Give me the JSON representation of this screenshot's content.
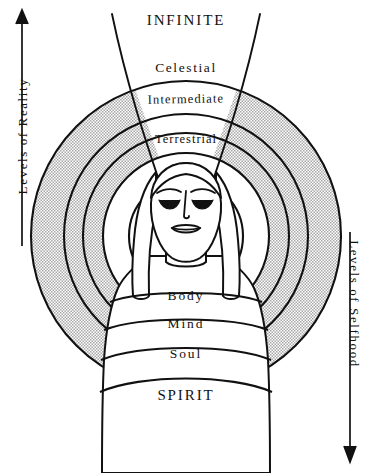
{
  "diagram": {
    "title_top": "INFINITE",
    "title_bottom": "SPIRIT",
    "left_axis": {
      "label": "Levels of Reality",
      "arrow_direction": "up",
      "icon": "up-arrow-icon"
    },
    "right_axis": {
      "label": "Levels of Selfhood",
      "arrow_direction": "down",
      "icon": "down-arrow-icon"
    },
    "outer_rings": [
      {
        "label": "Celestial",
        "ring_index": 1,
        "shaded": false
      },
      {
        "label": "Intermediate",
        "ring_index": 2,
        "shaded": false
      },
      {
        "label": "Terrestrial",
        "ring_index": 3,
        "shaded": false
      }
    ],
    "inner_rings": [
      {
        "label": "Body",
        "ring_index": 1
      },
      {
        "label": "Mind",
        "ring_index": 2
      },
      {
        "label": "Soul",
        "ring_index": 3
      }
    ],
    "figure": {
      "name": "human-figure",
      "description": "frontal human figure with closed eyes and long hair"
    },
    "colors": {
      "ink": "#111111",
      "background": "#ffffff",
      "shading": "#c9c9c9"
    }
  }
}
